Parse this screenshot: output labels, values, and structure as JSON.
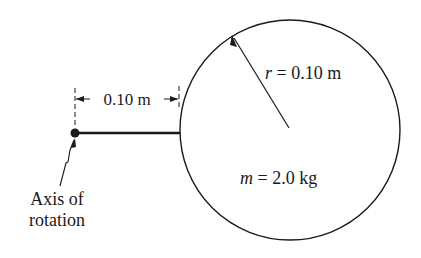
{
  "diagram": {
    "dimension_label": "0.10 m",
    "radius_label": {
      "var": "r",
      "eq": " = 0.10 m"
    },
    "mass_label": {
      "var": "m",
      "eq": " = 2.0 kg"
    },
    "axis_label_line1": "Axis of",
    "axis_label_line2": "rotation",
    "colors": {
      "ink": "#1a1a1a",
      "background": "#ffffff"
    }
  }
}
